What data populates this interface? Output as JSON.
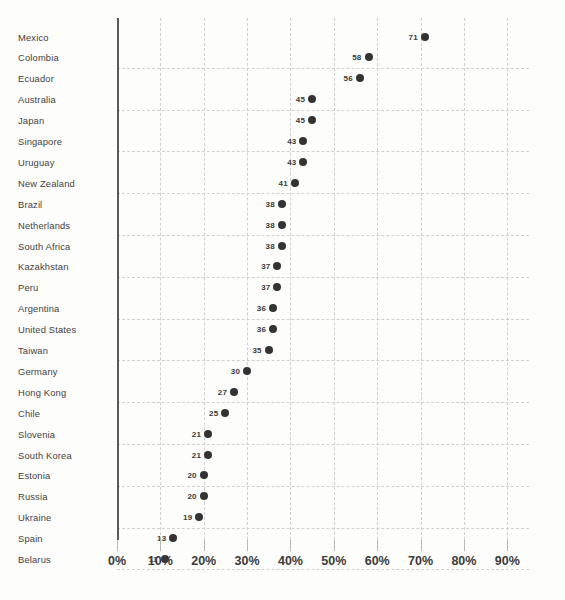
{
  "chart_data": {
    "type": "scatter",
    "title": "",
    "subtitle": "",
    "xlabel": "",
    "ylabel": "",
    "orientation": "horizontal",
    "grid": true,
    "legend": null,
    "xlim": [
      0,
      95
    ],
    "xticks": [
      0,
      10,
      20,
      30,
      40,
      50,
      60,
      70,
      80,
      90
    ],
    "xtick_labels": [
      "0%",
      "10%",
      "20%",
      "30%",
      "40%",
      "50%",
      "60%",
      "70%",
      "80%",
      "90%"
    ],
    "value_suffix": "%",
    "categories": [
      "Mexico",
      "Colombia",
      "Ecuador",
      "Australia",
      "Japan",
      "Singapore",
      "Uruguay",
      "New Zealand",
      "Brazil",
      "Netherlands",
      "South Africa",
      "Kazakhstan",
      "Peru",
      "Argentina",
      "United States",
      "Taiwan",
      "Germany",
      "Hong Kong",
      "Chile",
      "Slovenia",
      "South Korea",
      "Estonia",
      "Russia",
      "Ukraine",
      "Spain",
      "Belarus"
    ],
    "values": [
      71,
      58,
      56,
      45,
      45,
      43,
      43,
      41,
      38,
      38,
      38,
      37,
      37,
      36,
      36,
      35,
      30,
      27,
      25,
      21,
      21,
      20,
      20,
      19,
      13,
      11
    ],
    "point_labels": [
      "71",
      "58",
      "56",
      "45",
      "45",
      "43",
      "43",
      "41",
      "38",
      "38",
      "38",
      "37",
      "37",
      "36",
      "36",
      "35",
      "30",
      "27",
      "25",
      "21",
      "21",
      "20",
      "20",
      "19",
      "13",
      "11"
    ],
    "colors": {
      "background": "#fdfdfc",
      "dot": "#333333",
      "label_text": "#3f3f3f",
      "value_text": "#3a3a3a",
      "gridline": "#cfcfcf",
      "axis_line": "#5a5a5a",
      "tick_label": "#3b3b3b"
    }
  }
}
